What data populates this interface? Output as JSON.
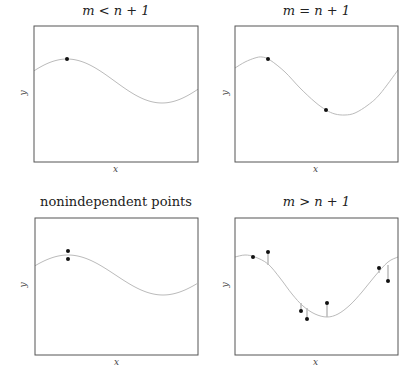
{
  "chart_data": [
    {
      "type": "scatter",
      "title": "m < n + 1",
      "xlabel": "x",
      "ylabel": "y",
      "box": {
        "x0": 34,
        "y0": 26,
        "x1": 198,
        "y1": 162
      },
      "curve": {
        "kind": "sine",
        "amp": 22,
        "mid": 81,
        "period": 190,
        "phase_x": 67,
        "peak_y": 59
      },
      "points": [
        {
          "x": 67,
          "y": 59
        }
      ],
      "residuals": false,
      "grid": false
    },
    {
      "type": "scatter",
      "title": "m = n + 1",
      "xlabel": "x",
      "ylabel": "y",
      "box": {
        "x0": 235,
        "y0": 26,
        "x1": 398,
        "y1": 162
      },
      "curve_points": [
        [
          235,
          68
        ],
        [
          245,
          62
        ],
        [
          255,
          58
        ],
        [
          262,
          57
        ],
        [
          270,
          60
        ],
        [
          285,
          72
        ],
        [
          300,
          88
        ],
        [
          315,
          102
        ],
        [
          326,
          110
        ],
        [
          335,
          114
        ],
        [
          345,
          115
        ],
        [
          355,
          113
        ],
        [
          368,
          105
        ],
        [
          380,
          94
        ],
        [
          398,
          70
        ]
      ],
      "points": [
        {
          "x": 268,
          "y": 59
        },
        {
          "x": 326,
          "y": 110
        }
      ],
      "residuals": false,
      "grid": false
    },
    {
      "type": "scatter",
      "title": "nonindependent points",
      "xlabel": "x",
      "ylabel": "y",
      "box": {
        "x0": 35,
        "y0": 218,
        "x1": 198,
        "y1": 355
      },
      "curve": {
        "kind": "sine",
        "amp": 20,
        "mid": 275,
        "period": 190,
        "phase_x": 68,
        "peak_y": 255
      },
      "points": [
        {
          "x": 68,
          "y": 251
        },
        {
          "x": 68,
          "y": 259
        }
      ],
      "residuals": false,
      "grid": false
    },
    {
      "type": "scatter",
      "title": "m > n + 1",
      "xlabel": "x",
      "ylabel": "y",
      "box": {
        "x0": 235,
        "y0": 218,
        "x1": 398,
        "y1": 355
      },
      "curve_points": [
        [
          235,
          257
        ],
        [
          245,
          255
        ],
        [
          255,
          257
        ],
        [
          268,
          264
        ],
        [
          280,
          278
        ],
        [
          292,
          294
        ],
        [
          303,
          306
        ],
        [
          315,
          314
        ],
        [
          327,
          317
        ],
        [
          338,
          314
        ],
        [
          350,
          305
        ],
        [
          362,
          292
        ],
        [
          375,
          276
        ],
        [
          388,
          262
        ],
        [
          398,
          257
        ]
      ],
      "points": [
        {
          "x": 253,
          "y": 257,
          "fit_y": 257
        },
        {
          "x": 268,
          "y": 252,
          "fit_y": 265
        },
        {
          "x": 301,
          "y": 311,
          "fit_y": 303
        },
        {
          "x": 307,
          "y": 319,
          "fit_y": 308
        },
        {
          "x": 327,
          "y": 303,
          "fit_y": 317
        },
        {
          "x": 379,
          "y": 268,
          "fit_y": 273
        },
        {
          "x": 388,
          "y": 281,
          "fit_y": 265
        }
      ],
      "residuals": true,
      "grid": false
    }
  ],
  "panels": [
    {
      "title": "m < n + 1",
      "xlabel": "x",
      "ylabel": "y"
    },
    {
      "title": "m = n + 1",
      "xlabel": "x",
      "ylabel": "y"
    },
    {
      "title": "nonindependent points",
      "xlabel": "x",
      "ylabel": "y"
    },
    {
      "title": "m > n + 1",
      "xlabel": "x",
      "ylabel": "y"
    }
  ],
  "colors": {
    "frame": "#555555",
    "curve": "#bbbbbb",
    "point": "#111111",
    "residual": "#999999"
  }
}
